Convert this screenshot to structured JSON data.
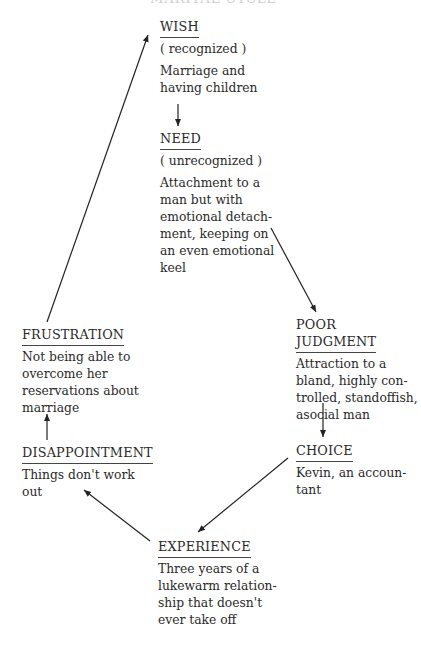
{
  "title": "MARITAL CYCLE",
  "nodes": {
    "wish": {
      "label": "WISH",
      "sub": "( recognized )",
      "desc": [
        "Marriage and",
        "having children"
      ]
    },
    "need": {
      "label": "NEED",
      "sub": "( unrecognized )",
      "desc": [
        "Attachment to a",
        "man but with",
        "emotional detach-",
        "ment, keeping on",
        "an even emotional",
        "keel"
      ]
    },
    "poor_judgment": {
      "label": [
        "POOR",
        "JUDGMENT"
      ],
      "desc": [
        "Attraction to a",
        "bland, highly con-",
        "trolled, standoffish,",
        "asocial man"
      ]
    },
    "choice": {
      "label": "CHOICE",
      "desc": [
        "Kevin, an accoun-",
        "tant"
      ]
    },
    "experience": {
      "label": "EXPERIENCE",
      "desc": [
        "Three years of a",
        "lukewarm relation-",
        "ship that doesn't",
        "ever take off"
      ]
    },
    "disappointment": {
      "label": "DISAPPOINTMENT",
      "desc": [
        "Things don't work",
        "out"
      ]
    },
    "frustration": {
      "label": "FRUSTRATION",
      "desc": [
        "Not being able to",
        "overcome her",
        "reservations about",
        "marriage"
      ]
    }
  },
  "edges": [
    {
      "from": "wish",
      "to": "need"
    },
    {
      "from": "need",
      "to": "poor_judgment"
    },
    {
      "from": "poor_judgment",
      "to": "choice"
    },
    {
      "from": "choice",
      "to": "experience"
    },
    {
      "from": "experience",
      "to": "disappointment"
    },
    {
      "from": "disappointment",
      "to": "frustration"
    },
    {
      "from": "frustration",
      "to": "wish"
    }
  ]
}
